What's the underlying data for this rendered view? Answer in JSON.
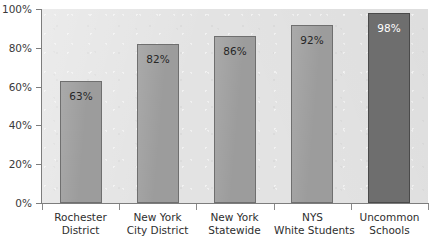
{
  "chart_data": {
    "type": "bar",
    "title": "",
    "title_clipped": true,
    "xlabel": "",
    "ylabel": "",
    "categories": [
      "Rochester District",
      "New York City District",
      "New York Statewide",
      "NYS White Students",
      "Uncommon Schools"
    ],
    "category_lines": [
      [
        "Rochester",
        "District"
      ],
      [
        "New York",
        "City District"
      ],
      [
        "New York",
        "Statewide"
      ],
      [
        "NYS",
        "White Students"
      ],
      [
        "Uncommon",
        "Schools"
      ]
    ],
    "values": [
      63,
      82,
      86,
      92,
      98
    ],
    "data_labels": [
      "63%",
      "82%",
      "86%",
      "92%",
      "98%"
    ],
    "ylim": [
      0,
      100
    ],
    "ytick_values": [
      0,
      20,
      40,
      60,
      80,
      100
    ],
    "ytick_labels": [
      "0%",
      "20%",
      "40%",
      "60%",
      "80%",
      "100%"
    ],
    "grid": false,
    "legend": false,
    "highlight_index": 4,
    "colors": {
      "bar": "#9c9c9c",
      "bar_highlight": "#6e6e6e",
      "bar_border": "#6f6f6f",
      "plot_background": "#e3e3e3",
      "page_background": "#ffffff",
      "axis": "#7d7d7d",
      "label_text": "#2e2e2e",
      "value_text": "#272727",
      "value_text_highlight": "#ffffff"
    }
  }
}
